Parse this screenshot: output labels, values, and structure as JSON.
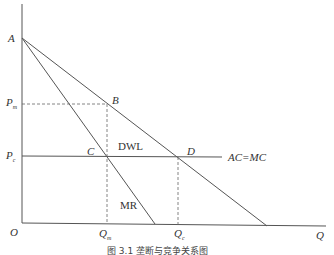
{
  "diagram": {
    "caption": "图 3.1   垄断与竞争关系图",
    "axes": {
      "y_label": "",
      "x_label": "Q",
      "origin_label": "O"
    },
    "points": {
      "A": "A",
      "B": "B",
      "C": "C",
      "D": "D"
    },
    "price_labels": {
      "pm_main": "P",
      "pm_sub": "m",
      "pc_main": "P",
      "pc_sub": "c"
    },
    "quantity_labels": {
      "qm_main": "Q",
      "qm_sub": "m",
      "qc_main": "Q",
      "qc_sub": "c"
    },
    "curves": {
      "mr": "MR",
      "ac_mc": "AC=MC",
      "dwl": "DWL"
    },
    "colors": {
      "line": "#555555",
      "text": "#333333",
      "background": "#ffffff"
    }
  }
}
